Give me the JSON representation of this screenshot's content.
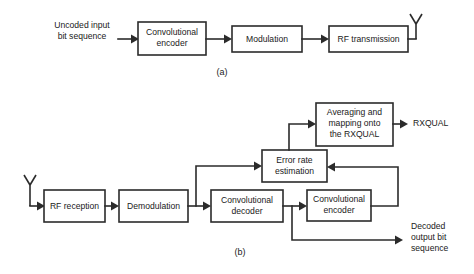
{
  "figure": {
    "caption_a": "(a)",
    "caption_b": "(b)"
  },
  "diagram_a": {
    "input_label_line1": "Uncoded input",
    "input_label_line2": "bit sequence",
    "blocks": [
      {
        "line1": "Convolutional",
        "line2": "encoder"
      },
      {
        "line1": "Modulation",
        "line2": ""
      },
      {
        "line1": "RF transmission",
        "line2": ""
      }
    ],
    "antenna_name": "transmit-antenna"
  },
  "diagram_b": {
    "blocks": [
      {
        "line1": "RF reception",
        "line2": "",
        "line3": ""
      },
      {
        "line1": "Demodulation",
        "line2": "",
        "line3": ""
      },
      {
        "line1": "Convolutional",
        "line2": "decoder",
        "line3": ""
      },
      {
        "line1": "Convolutional",
        "line2": "encoder",
        "line3": ""
      },
      {
        "line1": "Error rate",
        "line2": "estimation",
        "line3": ""
      },
      {
        "line1": "Averaging and",
        "line2": "mapping onto",
        "line3": "the RXQUAL"
      }
    ],
    "output_rxqual": "RXQUAL",
    "output_decoded_line1": "Decoded",
    "output_decoded_line2": "output bit",
    "output_decoded_line3": "sequence",
    "antenna_name": "receive-antenna"
  },
  "style": {
    "line_color": "#2b2b2b",
    "text_color": "#1a1a1a",
    "background": "#ffffff"
  }
}
